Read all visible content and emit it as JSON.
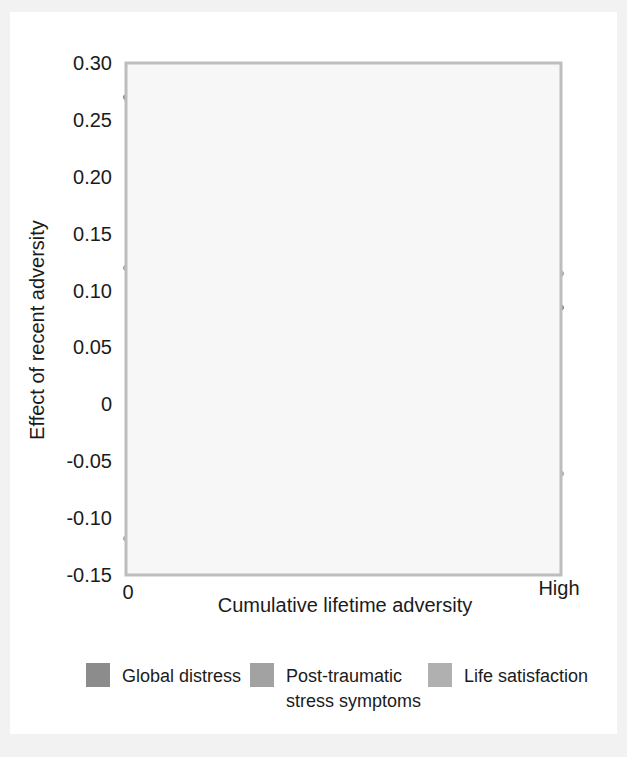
{
  "chart_data": {
    "type": "line",
    "title": "",
    "xlabel": "Cumulative lifetime adversity",
    "ylabel": "Effect of recent adversity",
    "xlim": [
      0,
      1
    ],
    "ylim": [
      -0.15,
      0.3
    ],
    "grid": true,
    "legend_position": "bottom",
    "x_tick_labels": [
      "0",
      "High"
    ],
    "y_tick_labels": [
      "0.30",
      "0.25",
      "0.20",
      "0.15",
      "0.10",
      "0.05",
      "0",
      "-0.05",
      "-0.10",
      "-0.15"
    ],
    "y_tick_values": [
      0.3,
      0.25,
      0.2,
      0.15,
      0.1,
      0.05,
      0,
      -0.05,
      -0.1,
      -0.15
    ],
    "x_gridline_count": 9,
    "x": [
      0,
      0.1,
      0.2,
      0.3,
      0.4,
      0.5,
      0.6,
      0.7,
      0.8,
      0.9,
      1.0
    ],
    "series": [
      {
        "name": "Global distress",
        "color": "#8c8c8c",
        "values": [
          0.27,
          0.213,
          0.164,
          0.123,
          0.09,
          0.065,
          0.047,
          0.038,
          0.04,
          0.057,
          0.085
        ]
      },
      {
        "name": "Post-traumatic stress symptoms",
        "color": "#a8a8a8",
        "values": [
          0.12,
          0.091,
          0.068,
          0.05,
          0.037,
          0.028,
          0.025,
          0.032,
          0.05,
          0.078,
          0.115
        ]
      },
      {
        "name": "Life satisfaction",
        "color": "#b0b0b0",
        "values": [
          -0.118,
          -0.084,
          -0.055,
          -0.031,
          -0.012,
          0.002,
          0.009,
          0.009,
          0.0,
          -0.026,
          -0.061
        ]
      }
    ]
  },
  "legend": {
    "items": [
      {
        "label": "Global distress",
        "color": "#8c8c8c"
      },
      {
        "label": "Post-traumatic",
        "label2": "stress symptoms",
        "color": "#a2a2a2"
      },
      {
        "label": "Life satisfaction",
        "color": "#b0b0b0"
      }
    ]
  },
  "axis": {
    "y_title": "Effect of recent adversity",
    "x_title": "Cumulative lifetime adversity",
    "x_min_label": "0",
    "x_max_label": "High"
  },
  "colors": {
    "page_background": "#f2f2f2",
    "card_background": "#ffffff",
    "plot_background": "#f7f7f7",
    "frame": "#bdbdbd",
    "grid": "#cfcfcf",
    "text": "#1b1b1b"
  }
}
